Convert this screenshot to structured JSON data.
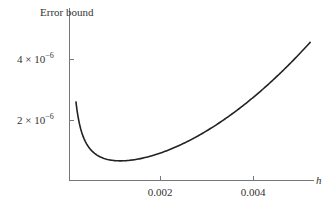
{
  "chart_data": {
    "type": "line",
    "title": "",
    "ylabel": "Error bound",
    "xlabel": "h",
    "xticks": [
      0.002,
      0.004
    ],
    "xtick_labels": [
      "0.002",
      "0.004"
    ],
    "yticks": [
      2e-06,
      4e-06
    ],
    "ytick_labels": [
      {
        "mantissa": "2 × 10",
        "exp": "−6"
      },
      {
        "mantissa": "4 × 10",
        "exp": "−6"
      }
    ],
    "xlim": [
      0,
      0.0053
    ],
    "ylim": [
      0,
      5.2e-06
    ],
    "grid": false,
    "legend": null,
    "series": [
      {
        "name": "Error bound",
        "formula": "5e-10/h + h^2/6",
        "x": [
          0.0001,
          0.00015,
          0.0002,
          0.0003,
          0.0004,
          0.0005,
          0.0006,
          0.0008,
          0.001,
          0.00114,
          0.0013,
          0.0016,
          0.002,
          0.0025,
          0.003,
          0.0035,
          0.004,
          0.0045,
          0.005,
          0.0052
        ],
        "values": [
          5e-06,
          3.34e-06,
          2.51e-06,
          1.68e-06,
          1.28e-06,
          1.04e-06,
          8.9e-07,
          7.3e-07,
          6.7e-07,
          6.6e-07,
          6.7e-07,
          7.4e-07,
          9.2e-07,
          1.24e-06,
          1.67e-06,
          2.19e-06,
          2.79e-06,
          3.49e-06,
          4.27e-06,
          4.6e-06
        ]
      }
    ],
    "color": "#222222"
  }
}
